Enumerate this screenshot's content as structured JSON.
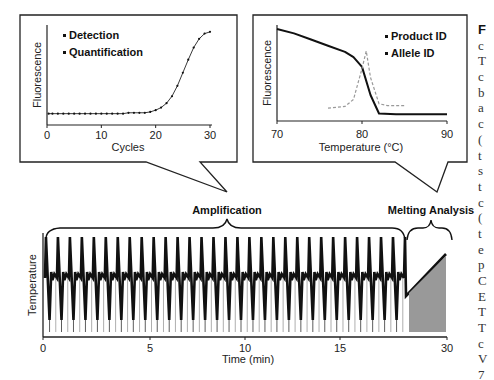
{
  "left_callout": {
    "bullets": [
      "Detection",
      "Quantification"
    ],
    "ylabel": "Fluorescence",
    "xlabel": "Cycles",
    "xticks": [
      "0",
      "10",
      "20",
      "30"
    ]
  },
  "right_callout": {
    "bullets": [
      "Product ID",
      "Allele ID"
    ],
    "ylabel": "Fluorescence",
    "xlabel": "Temperature (°C)",
    "xticks": [
      "70",
      "80",
      "90"
    ]
  },
  "main_chart": {
    "phase_labels": [
      "Amplification",
      "Melting Analysis"
    ],
    "ylabel": "Temperature",
    "xlabel": "Time (min)",
    "xticks": [
      "0",
      "5",
      "10",
      "15",
      "30"
    ]
  },
  "right_text_column": [
    "F",
    "c",
    "T",
    "c",
    "b",
    "a",
    "c",
    "(",
    "t",
    "s",
    "t",
    "c",
    "(",
    "t",
    "e",
    "p",
    "C",
    "E",
    "T",
    "T",
    "c",
    "V",
    "7"
  ],
  "colors": {
    "line": "#111111",
    "dashed": "#999999",
    "fill": "#999999",
    "text": "#111111"
  },
  "chart_data": [
    {
      "type": "line",
      "title": "Amplification curve",
      "xlabel": "Cycles",
      "ylabel": "Fluorescence",
      "x": [
        1,
        2,
        3,
        4,
        5,
        6,
        7,
        8,
        9,
        10,
        11,
        12,
        13,
        14,
        15,
        16,
        17,
        18,
        19,
        20,
        21,
        22,
        23,
        24,
        25,
        26,
        27,
        28,
        29,
        30
      ],
      "values": [
        0.05,
        0.05,
        0.05,
        0.05,
        0.05,
        0.05,
        0.05,
        0.05,
        0.05,
        0.05,
        0.05,
        0.05,
        0.05,
        0.05,
        0.06,
        0.06,
        0.06,
        0.06,
        0.07,
        0.09,
        0.12,
        0.17,
        0.25,
        0.37,
        0.52,
        0.67,
        0.81,
        0.91,
        0.97,
        0.99
      ],
      "xlim": [
        0,
        30
      ],
      "annotations": [
        "Detection",
        "Quantification"
      ]
    },
    {
      "type": "line",
      "title": "Melting curve",
      "xlabel": "Temperature (°C)",
      "ylabel": "Fluorescence",
      "series": [
        {
          "name": "Fluorescence (solid)",
          "x": [
            70,
            72,
            74,
            76,
            78,
            79,
            80,
            81,
            82,
            84,
            86,
            88,
            90
          ],
          "values": [
            1.0,
            0.95,
            0.88,
            0.81,
            0.74,
            0.68,
            0.57,
            0.25,
            0.04,
            0.03,
            0.03,
            0.03,
            0.03
          ]
        },
        {
          "name": "Derivative (dashed)",
          "x": [
            76,
            78,
            79,
            80,
            80.5,
            81,
            82,
            83,
            85
          ],
          "values": [
            0.1,
            0.12,
            0.2,
            0.55,
            0.75,
            0.45,
            0.15,
            0.13,
            0.13
          ]
        }
      ],
      "xlim": [
        70,
        90
      ],
      "annotations": [
        "Product ID",
        "Allele ID"
      ]
    },
    {
      "type": "line",
      "title": "Thermal cycling profile",
      "xlabel": "Time (min)",
      "ylabel": "Temperature",
      "cycles": 30,
      "phases": [
        {
          "name": "Amplification",
          "x_range": [
            0,
            21
          ]
        },
        {
          "name": "Melting Analysis",
          "x_range": [
            21,
            30
          ]
        }
      ],
      "xlim": [
        0,
        30
      ]
    }
  ]
}
